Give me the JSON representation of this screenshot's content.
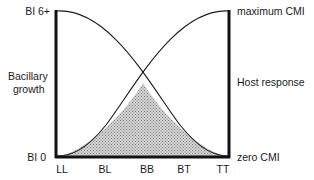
{
  "diagram": {
    "left_axis": {
      "top_label": "BI 6+",
      "bottom_label": "BI 0",
      "title_line1": "Bacillary",
      "title_line2": "growth"
    },
    "right_axis": {
      "top_label": "maximum CMI",
      "bottom_label": "zero CMI",
      "title": "Host response"
    },
    "x_axis": {
      "categories": [
        "LL",
        "BL",
        "BB",
        "BT",
        "TT"
      ]
    },
    "curves": [
      {
        "name": "Bacillary growth",
        "shape": "decreasing from BI 6+ at LL to BI 0 at TT"
      },
      {
        "name": "Host response (CMI)",
        "shape": "increasing from zero CMI at LL to maximum CMI at TT"
      }
    ],
    "shaded_region": "area under both curves, peaking at BB",
    "colors": {
      "line": "#1a1a1a",
      "shading": "#bdbdbd",
      "background": "#ffffff"
    }
  }
}
